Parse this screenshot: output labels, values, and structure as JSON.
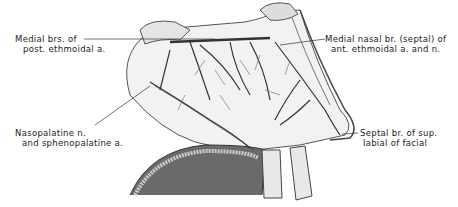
{
  "figure": {
    "labels": {
      "top_left": [
        "Medial brs. of",
        "post. ethmoidal a."
      ],
      "top_right": [
        "Medial nasal br. (septal) of",
        "ant. ethmoidal a. and n."
      ],
      "bottom_left": [
        "Nasopalatine n.",
        "and sphenopalatine a."
      ],
      "bottom_right": [
        "Septal br. of sup.",
        "labial of facial"
      ]
    },
    "colors": {
      "ink": "#222222",
      "shade": "#5a5a5a",
      "membrane": "#f2f2f2",
      "background": "#ffffff"
    }
  }
}
